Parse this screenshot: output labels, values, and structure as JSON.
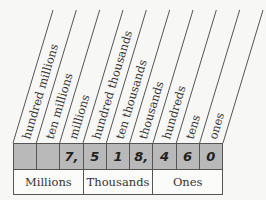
{
  "place_value_headers": [
    "hundred millions",
    "ten millions",
    "millions",
    "hundred thousands",
    "ten thousands",
    "thousands",
    "hundreds",
    "tens",
    "ones"
  ],
  "digits": [
    "",
    "",
    "7,",
    "5",
    "1",
    "8,",
    "4",
    "6",
    "0"
  ],
  "periods": [
    "Millions",
    "Thousands",
    "Ones"
  ],
  "colors": {
    "digit_row": "#b9b9b9",
    "lines": "#555555",
    "background": "#f7f7f5"
  }
}
